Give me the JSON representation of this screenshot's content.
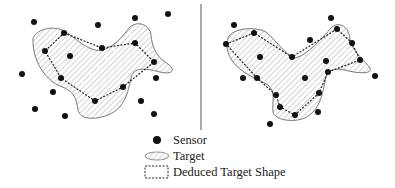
{
  "legend": {
    "sensor_label": "Sensor",
    "target_label": "Target",
    "deduced_label": "Deduced Target Shape"
  },
  "colors": {
    "sensor": "#111111",
    "target_outline": "#777777",
    "hatch": "#bbbbbb",
    "deduced_outline": "#222222",
    "divider": "#555555"
  },
  "panels": [
    {
      "name": "left",
      "sensors": [
        [
          34,
          22
        ],
        [
          98,
          25
        ],
        [
          135,
          18
        ],
        [
          168,
          14
        ],
        [
          64,
          33
        ],
        [
          45,
          51
        ],
        [
          102,
          48
        ],
        [
          70,
          56
        ],
        [
          22,
          74
        ],
        [
          61,
          78
        ],
        [
          122,
          61
        ],
        [
          156,
          78
        ],
        [
          53,
          92
        ],
        [
          123,
          87
        ],
        [
          95,
          101
        ],
        [
          35,
          109
        ],
        [
          65,
          116
        ],
        [
          141,
          101
        ],
        [
          154,
          114
        ]
      ],
      "deduced_shape": [
        [
          64,
          33
        ],
        [
          102,
          48
        ],
        [
          135,
          43
        ],
        [
          154,
          62
        ],
        [
          123,
          87
        ],
        [
          95,
          101
        ],
        [
          61,
          78
        ],
        [
          45,
          51
        ]
      ]
    },
    {
      "name": "right",
      "sensors": [
        [
          234,
          25
        ],
        [
          331,
          18
        ],
        [
          254,
          33
        ],
        [
          337,
          29
        ],
        [
          310,
          40
        ],
        [
          226,
          44
        ],
        [
          352,
          43
        ],
        [
          292,
          57
        ],
        [
          260,
          57
        ],
        [
          326,
          61
        ],
        [
          360,
          60
        ],
        [
          328,
          72
        ],
        [
          243,
          78
        ],
        [
          257,
          78
        ],
        [
          305,
          78
        ],
        [
          375,
          76
        ],
        [
          276,
          95
        ],
        [
          319,
          93
        ],
        [
          280,
          107
        ],
        [
          318,
          112
        ],
        [
          295,
          115
        ],
        [
          270,
          124
        ]
      ],
      "deduced_shape": [
        [
          226,
          44
        ],
        [
          254,
          33
        ],
        [
          292,
          57
        ],
        [
          337,
          29
        ],
        [
          352,
          43
        ],
        [
          360,
          60
        ],
        [
          328,
          72
        ],
        [
          319,
          93
        ],
        [
          295,
          115
        ],
        [
          280,
          107
        ],
        [
          276,
          95
        ],
        [
          257,
          78
        ]
      ]
    }
  ]
}
